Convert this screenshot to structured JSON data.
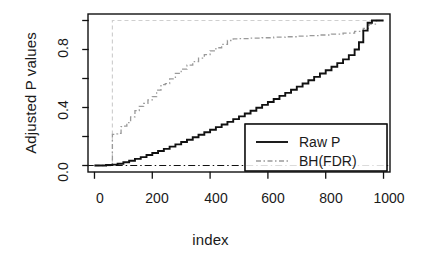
{
  "chart_data": {
    "type": "line",
    "title": "",
    "xlabel": "index",
    "ylabel": "Adjusted P values",
    "xlim": [
      -20,
      1020
    ],
    "ylim": [
      -0.04,
      1.04
    ],
    "xticks": [
      0,
      200,
      400,
      600,
      800,
      1000
    ],
    "xtick_labels": [
      "0",
      "200",
      "400",
      "600",
      "800",
      "1000"
    ],
    "yticks": [
      0.0,
      0.2,
      0.4,
      0.6,
      0.8,
      1.0
    ],
    "ytick_labels": [
      "0.0",
      "",
      "0.4",
      "",
      "0.8",
      ""
    ],
    "grid": false,
    "legend_position": "center-right",
    "series": [
      {
        "name": "Raw P",
        "style": "solid",
        "color": "#111111",
        "width": 1.8,
        "x": [
          0,
          40,
          62,
          80,
          100,
          120,
          140,
          160,
          180,
          200,
          220,
          240,
          260,
          280,
          300,
          320,
          340,
          360,
          380,
          400,
          420,
          440,
          460,
          480,
          500,
          520,
          540,
          560,
          580,
          600,
          620,
          640,
          660,
          680,
          700,
          720,
          740,
          760,
          780,
          800,
          820,
          840,
          860,
          880,
          900,
          915,
          930,
          945,
          960,
          1000
        ],
        "y": [
          0.0,
          0.003,
          0.006,
          0.012,
          0.022,
          0.033,
          0.046,
          0.058,
          0.072,
          0.086,
          0.1,
          0.115,
          0.13,
          0.146,
          0.162,
          0.178,
          0.195,
          0.212,
          0.229,
          0.247,
          0.265,
          0.283,
          0.301,
          0.32,
          0.339,
          0.359,
          0.378,
          0.398,
          0.418,
          0.438,
          0.459,
          0.48,
          0.501,
          0.522,
          0.544,
          0.566,
          0.588,
          0.611,
          0.634,
          0.657,
          0.681,
          0.706,
          0.732,
          0.761,
          0.8,
          0.85,
          0.93,
          0.985,
          1.0,
          1.0
        ]
      },
      {
        "name": "BH(FDR)",
        "style": "dotdash",
        "color": "#9a9a9a",
        "width": 1.3,
        "x": [
          0,
          58,
          62,
          62,
          70,
          80,
          92,
          100,
          112,
          125,
          140,
          155,
          170,
          185,
          200,
          215,
          230,
          245,
          260,
          280,
          300,
          320,
          340,
          360,
          380,
          400,
          420,
          440,
          460,
          480,
          500,
          540,
          580,
          620,
          660,
          700,
          740,
          780,
          820,
          860,
          900,
          930,
          950,
          975,
          1000
        ],
        "y": [
          0.0,
          0.0,
          0.0,
          0.215,
          0.218,
          0.221,
          0.268,
          0.272,
          0.296,
          0.335,
          0.378,
          0.408,
          0.428,
          0.452,
          0.475,
          0.52,
          0.558,
          0.565,
          0.598,
          0.635,
          0.665,
          0.692,
          0.716,
          0.74,
          0.765,
          0.79,
          0.812,
          0.836,
          0.862,
          0.873,
          0.875,
          0.878,
          0.881,
          0.885,
          0.888,
          0.892,
          0.896,
          0.9,
          0.906,
          0.913,
          0.925,
          0.945,
          0.975,
          1.0,
          1.0
        ]
      },
      {
        "name": "bonferroni-reference",
        "style": "dashed",
        "color": "#cfcfcf",
        "width": 1.2,
        "x": [
          0,
          60,
          62,
          62,
          1000
        ],
        "y": [
          0.0,
          0.0,
          0.0,
          1.0,
          1.0
        ]
      }
    ],
    "reference_lines": [
      {
        "name": "zero-line",
        "orientation": "horizontal",
        "value": 0.0,
        "style": "dotdash",
        "color": "#111111",
        "width": 1.1
      }
    ],
    "legend": {
      "entries": [
        {
          "label": "Raw P",
          "style": "solid",
          "color": "#111111"
        },
        {
          "label": "BH(FDR)",
          "style": "dotdash",
          "color": "#9a9a9a"
        }
      ]
    }
  },
  "axes": {
    "ylabel": "Adjusted P values",
    "xlabel": "index",
    "xtick_labels": [
      "0",
      "200",
      "400",
      "600",
      "800",
      "1000"
    ],
    "ytick_labels": [
      "0.0",
      "0.4",
      "0.8"
    ]
  },
  "legend": {
    "raw_label": "Raw P",
    "bh_label": "BH(FDR)"
  },
  "colors": {
    "frame": "#111111",
    "raw": "#111111",
    "bh": "#9a9a9a",
    "reference": "#cfcfcf",
    "background": "#ffffff"
  }
}
